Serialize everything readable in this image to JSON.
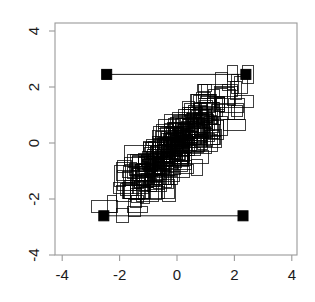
{
  "chart_data": {
    "type": "scatter",
    "title": "",
    "subtitle": "",
    "xlabel": "",
    "ylabel": "",
    "xlim": [
      -4.6,
      4.6
    ],
    "ylim": [
      -4.6,
      4.6
    ],
    "xticks": [
      -4,
      -2,
      0,
      2,
      4
    ],
    "yticks": [
      -4,
      -2,
      0,
      2,
      4
    ],
    "xticklabels": [
      "-4",
      "-2",
      "0",
      "2",
      "4"
    ],
    "yticklabels": [
      "-4",
      "-2",
      "0",
      "2",
      "4"
    ],
    "grid": false,
    "legend": null,
    "legend_position": "none",
    "marker_style": "open-rectangle",
    "marker_color": "#000000",
    "frame_color": "#9a9a9a",
    "axis_label_color": "#1a1a1a",
    "series": [
      {
        "name": "rectangles",
        "type": "open-rectangle-cloud",
        "correlation": 0.88,
        "count": 320,
        "x_mean": 0.0,
        "y_mean": -0.1,
        "x_sd": 1.0,
        "y_sd": 1.0,
        "rect_width_units": 0.55,
        "rect_height_units": 0.45
      },
      {
        "name": "corner-markers",
        "type": "filled-square",
        "marker_size_px": 10,
        "points": [
          {
            "label": "top-left",
            "x": -2.45,
            "y": 2.45
          },
          {
            "label": "top-right",
            "x": 2.4,
            "y": 2.45
          },
          {
            "label": "bottom-left",
            "x": -2.55,
            "y": -2.6
          },
          {
            "label": "bottom-right",
            "x": 2.3,
            "y": -2.6
          }
        ]
      },
      {
        "name": "connector-lines",
        "type": "line",
        "segments": [
          {
            "label": "top-connector",
            "x1": -2.45,
            "y1": 2.45,
            "x2": 2.4,
            "y2": 2.45
          },
          {
            "label": "bottom-connector",
            "x1": -2.55,
            "y1": -2.6,
            "x2": 2.3,
            "y2": -2.6
          }
        ]
      }
    ]
  },
  "axes": {
    "x_tick_labels": [
      "-4",
      "-2",
      "0",
      "2",
      "4"
    ],
    "y_tick_labels": [
      "-4",
      "-2",
      "0",
      "2",
      "4"
    ]
  }
}
